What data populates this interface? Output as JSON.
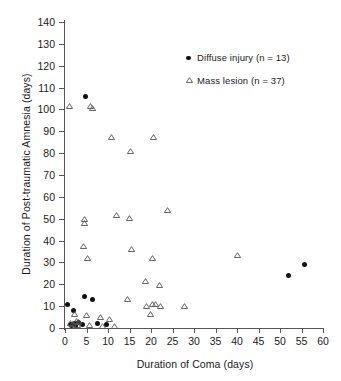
{
  "chart_data": {
    "type": "scatter",
    "title": "",
    "xlabel": "Duration of Coma (days)",
    "ylabel": "Duration of Post-traumatic Amnesia (days)",
    "xlim": [
      0,
      60
    ],
    "ylim": [
      0,
      140
    ],
    "xticks": [
      0,
      5,
      10,
      15,
      20,
      25,
      30,
      35,
      40,
      45,
      50,
      55,
      60
    ],
    "yticks": [
      0,
      10,
      20,
      30,
      40,
      50,
      60,
      70,
      80,
      90,
      100,
      110,
      120,
      130,
      140
    ],
    "grid": false,
    "legend_position": "upper-right",
    "series": [
      {
        "name": "Diffuse injury (n = 13)",
        "marker": "filled-circle",
        "color": "#111111",
        "count": 13,
        "points": [
          [
            0.6,
            10.7
          ],
          [
            1.9,
            7.8
          ],
          [
            1.2,
            1.4
          ],
          [
            1.6,
            1.0
          ],
          [
            2.1,
            2.2
          ],
          [
            2.4,
            1.2
          ],
          [
            3.1,
            2.4
          ],
          [
            4.0,
            1.6
          ],
          [
            4.7,
            106.0
          ],
          [
            4.6,
            14.6
          ],
          [
            6.3,
            12.9
          ],
          [
            7.6,
            2.0
          ],
          [
            9.6,
            1.7
          ],
          [
            52.0,
            24.2
          ],
          [
            55.8,
            29.0
          ]
        ]
      },
      {
        "name": "Mass lesion (n = 37)",
        "marker": "open-triangle",
        "color": "#555555",
        "count": 37,
        "points": [
          [
            1.0,
            101.6
          ],
          [
            6.0,
            101.4
          ],
          [
            6.4,
            100.8
          ],
          [
            10.8,
            87.4
          ],
          [
            20.6,
            87.3
          ],
          [
            15.2,
            80.9
          ],
          [
            23.8,
            54.0
          ],
          [
            11.9,
            51.7
          ],
          [
            15.0,
            50.4
          ],
          [
            4.6,
            49.8
          ],
          [
            4.6,
            48.2
          ],
          [
            4.3,
            37.3
          ],
          [
            40.0,
            33.5
          ],
          [
            5.2,
            31.9
          ],
          [
            20.3,
            31.9
          ],
          [
            15.4,
            36.3
          ],
          [
            18.8,
            21.6
          ],
          [
            21.9,
            19.8
          ],
          [
            14.6,
            13.3
          ],
          [
            19.0,
            10.1
          ],
          [
            20.3,
            10.8
          ],
          [
            21.0,
            10.9
          ],
          [
            22.3,
            10.0
          ],
          [
            27.9,
            10.0
          ],
          [
            2.1,
            6.3
          ],
          [
            19.8,
            6.2
          ],
          [
            5.1,
            5.9
          ],
          [
            8.2,
            5.2
          ],
          [
            10.4,
            3.9
          ],
          [
            2.6,
            3.3
          ],
          [
            3.2,
            2.6
          ],
          [
            1.3,
            2.3
          ],
          [
            1.8,
            1.8
          ],
          [
            2.9,
            1.2
          ],
          [
            5.6,
            1.2
          ],
          [
            8.8,
            1.1
          ],
          [
            11.4,
            1.0
          ]
        ]
      }
    ]
  },
  "legend": {
    "items": [
      {
        "label": "Diffuse injury (n = 13)",
        "marker": "filled-circle"
      },
      {
        "label": "Mass lesion (n = 37)",
        "marker": "open-triangle"
      }
    ]
  }
}
